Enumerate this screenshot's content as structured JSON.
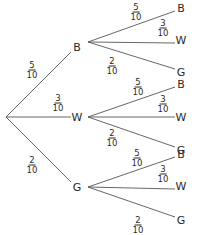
{
  "diagram": {
    "type": "probability-tree",
    "root": {
      "x": 6,
      "y": 117
    },
    "first_level": [
      {
        "label": "B",
        "prob": {
          "num": "5",
          "den": "10"
        },
        "node": {
          "x": 77,
          "y": 47
        },
        "label_pos": {
          "x": 32,
          "y": 70
        }
      },
      {
        "label": "W",
        "prob": {
          "num": "3",
          "den": "10"
        },
        "node": {
          "x": 77,
          "y": 117
        },
        "label_pos": {
          "x": 58,
          "y": 103
        }
      },
      {
        "label": "G",
        "prob": {
          "num": "2",
          "den": "10"
        },
        "node": {
          "x": 77,
          "y": 187
        },
        "label_pos": {
          "x": 32,
          "y": 165
        }
      }
    ],
    "second_level": [
      {
        "parent": "B",
        "start": {
          "x": 88,
          "y": 42
        },
        "branches": [
          {
            "label": "B",
            "prob": {
              "num": "5",
              "den": "10"
            },
            "end_y": 8,
            "label_pos": {
              "x": 136,
              "y": 12
            }
          },
          {
            "label": "W",
            "prob": {
              "num": "3",
              "den": "10"
            },
            "end_y": 40,
            "label_pos": {
              "x": 163,
              "y": 28
            }
          },
          {
            "label": "G",
            "prob": {
              "num": "2",
              "den": "10"
            },
            "end_y": 72,
            "label_pos": {
              "x": 112,
              "y": 66
            }
          }
        ]
      },
      {
        "parent": "W",
        "start": {
          "x": 88,
          "y": 117
        },
        "branches": [
          {
            "label": "B",
            "prob": {
              "num": "5",
              "den": "10"
            },
            "end_y": 84,
            "label_pos": {
              "x": 138,
              "y": 87
            }
          },
          {
            "label": "W",
            "prob": {
              "num": "3",
              "den": "10"
            },
            "end_y": 117,
            "label_pos": {
              "x": 163,
              "y": 104
            }
          },
          {
            "label": "G",
            "prob": {
              "num": "2",
              "den": "10"
            },
            "end_y": 150,
            "label_pos": {
              "x": 112,
              "y": 138
            }
          }
        ]
      },
      {
        "parent": "G",
        "start": {
          "x": 88,
          "y": 187
        },
        "branches": [
          {
            "label": "B",
            "prob": {
              "num": "5",
              "den": "10"
            },
            "end_y": 154,
            "label_pos": {
              "x": 137,
              "y": 158
            }
          },
          {
            "label": "W",
            "prob": {
              "num": "3",
              "den": "10"
            },
            "end_y": 186,
            "label_pos": {
              "x": 163,
              "y": 174
            }
          },
          {
            "label": "G",
            "prob": {
              "num": "2",
              "den": "10"
            },
            "end_y": 220,
            "label_pos": {
              "x": 138,
              "y": 225
            }
          }
        ]
      }
    ],
    "leaf_x": 175,
    "leaf_label_x": 181,
    "line_color": "#555555",
    "text_color": "#2a2a2a"
  }
}
